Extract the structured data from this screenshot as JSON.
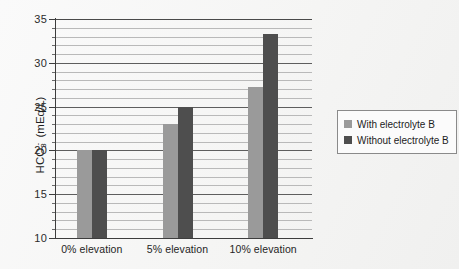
{
  "chart_data": {
    "type": "bar",
    "title": "",
    "subtitle": "",
    "xlabel": "",
    "ylabel": "HCO3- (mEq/L)",
    "ylabel_parts": {
      "prefix": "HCO",
      "sub": "3",
      "sup": "-",
      "suffix": " (mEq/L)"
    },
    "categories": [
      "0% elevation",
      "5% elevation",
      "10% elevation"
    ],
    "series": [
      {
        "name": "With electrolyte B",
        "color": "#9a9a9a",
        "values": [
          20,
          23,
          27.2
        ]
      },
      {
        "name": "Without electrolyte B",
        "color": "#4e4e4e",
        "values": [
          20,
          25,
          33.3
        ]
      }
    ],
    "ylim": [
      10,
      35
    ],
    "ytick_labels": [
      "10",
      "15",
      "20",
      "25",
      "30",
      "35"
    ],
    "ytick_values": [
      10,
      15,
      20,
      25,
      30,
      35
    ],
    "minor_tick_step": 1,
    "grid": "horizontal-major-and-minor",
    "legend_position": "right-outside",
    "legend_entries": [
      "With electrolyte B",
      "Without electrolyte B"
    ],
    "annotations": []
  },
  "axes": {
    "y": {
      "ticks": [
        {
          "label": "35",
          "value": 35
        },
        {
          "label": "30",
          "value": 30
        },
        {
          "label": "25",
          "value": 25
        },
        {
          "label": "20",
          "value": 20
        },
        {
          "label": "15",
          "value": 15
        },
        {
          "label": "10",
          "value": 10
        }
      ]
    },
    "x": {
      "ticks": [
        {
          "label": "0% elevation"
        },
        {
          "label": "5% elevation"
        },
        {
          "label": "10% elevation"
        }
      ]
    }
  },
  "legend": {
    "rows": [
      {
        "label": "With electrolyte B",
        "color": "#9a9a9a"
      },
      {
        "label": "Without electrolyte B",
        "color": "#4e4e4e"
      }
    ]
  },
  "colors": {
    "series_light": "#9a9a9a",
    "series_dark": "#4e4e4e",
    "axis": "#3d3d3d",
    "gridline_major": "#5e5e5e",
    "gridline_minor": "#b9b9b9",
    "background": "#fdfdfd"
  }
}
